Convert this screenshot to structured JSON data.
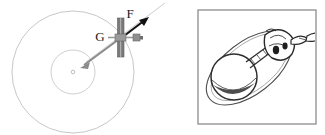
{
  "figure": {
    "panel_count": 2,
    "background_color": "#ffffff"
  },
  "left_panel": {
    "name": "orbit-force-diagram",
    "description": "Concentric circles representing orbital paths around a central body, with a satellite on the outer orbit and two labeled force vectors",
    "outer_orbit": {
      "label": "outer orbit circle",
      "center_x": 73,
      "center_y": 72,
      "radius": 61,
      "stroke_color": "#b9b9b9",
      "stroke_width": 0.8
    },
    "inner_orbit": {
      "label": "inner orbit circle",
      "center_x": 73,
      "center_y": 72,
      "radius": 22,
      "stroke_color": "#c2c2c2",
      "stroke_width": 0.8
    },
    "center_body": {
      "label": "central body marker",
      "center_x": 73,
      "center_y": 72,
      "radius": 1.6,
      "stroke_color": "#b0b0b0"
    },
    "satellite": {
      "label": "satellite",
      "center_x": 121,
      "center_y": 37,
      "body_color": "#8e8e8e",
      "panel_color": "#6f6f6f",
      "description": "small satellite with twin solar panels and horizontal body"
    },
    "vectors": [
      {
        "id": "F",
        "label": "F",
        "meaning": "thrust force vector",
        "color": "#111111",
        "direction": "up-right",
        "from_x": 121,
        "from_y": 37,
        "to_x": 148,
        "to_y": 17,
        "label_x": 131,
        "label_y": 15
      },
      {
        "id": "G",
        "label": "G",
        "meaning": "gravitational force vector toward center",
        "color": "#8a8a8a",
        "direction": "down-left",
        "from_x": 121,
        "from_y": 37,
        "to_x": 82,
        "to_y": 66,
        "label_x": 100,
        "label_y": 40
      }
    ],
    "tangent_line": {
      "label": "velocity tangent line",
      "color": "#c8c8c8",
      "from_x": 121,
      "from_y": 37,
      "to_x": 163,
      "to_y": 5
    }
  },
  "right_panel": {
    "name": "spacecraft-sketch",
    "description": "Framed hand-drawn ink sketch of a spherical capsule on an elliptical orbit path with an attached module and ribbon",
    "frame": {
      "label": "sketch frame border",
      "x": 12,
      "y": 10,
      "width": 118,
      "height": 114,
      "stroke_color": "#8c8c8c",
      "stroke_width": 1.2,
      "fill_color": "#ffffff"
    },
    "ellipse_orbit": {
      "label": "elliptical orbit path",
      "center_x": 63,
      "center_y": 66,
      "rx": 48,
      "ry": 25,
      "rotation_deg": -38,
      "stroke_color": "#4a4a4a",
      "stroke_width": 1.1
    },
    "sphere": {
      "label": "spherical capsule",
      "center_x": 48,
      "center_y": 78,
      "radius": 22,
      "stroke_color": "#2e2e2e",
      "fill_color": "#ffffff"
    },
    "module": {
      "label": "attached instrument module",
      "center_x": 92,
      "center_y": 45,
      "stroke_color": "#2a2a2a"
    },
    "ribbon": {
      "label": "trailing ribbon",
      "stroke_color": "#2a2a2a"
    },
    "tether": {
      "label": "tether connecting sphere to module",
      "stroke_color": "#3a3a3a"
    }
  }
}
